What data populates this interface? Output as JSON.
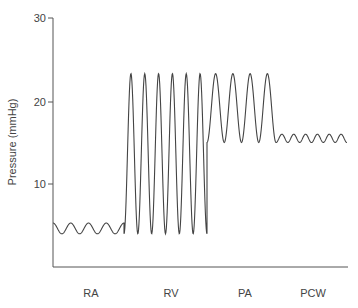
{
  "chart_data": {
    "type": "line",
    "title": "",
    "xlabel": "",
    "ylabel": "Pressure (mmHg)",
    "ylim": [
      0,
      30
    ],
    "yticks": [
      10,
      20,
      30
    ],
    "grid": false,
    "legend": null,
    "categories": [
      "RA",
      "RV",
      "PA",
      "PCW"
    ],
    "series": [
      {
        "name": "RA",
        "waveform": "sinusoid",
        "min": 4.0,
        "max": 5.3,
        "cycles": 4
      },
      {
        "name": "RV",
        "waveform": "sinusoid",
        "min": 4.0,
        "max": 23.3,
        "cycles": 6
      },
      {
        "name": "PA",
        "waveform": "sinusoid",
        "min": 15.0,
        "max": 23.3,
        "cycles": 4
      },
      {
        "name": "PCW",
        "waveform": "sinusoid",
        "min": 15.0,
        "max": 16.0,
        "cycles": 6
      }
    ]
  },
  "labels": {
    "ylabel": "Pressure (mmHg)",
    "ticks": [
      "10",
      "20",
      "30"
    ],
    "cats": [
      "RA",
      "RV",
      "PA",
      "PCW"
    ]
  }
}
